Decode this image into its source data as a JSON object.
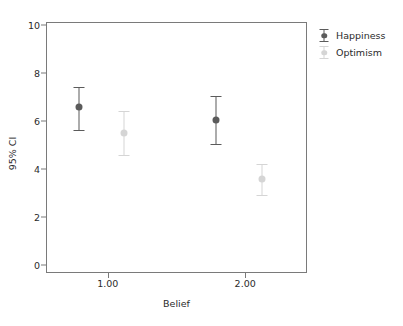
{
  "chart_data": {
    "type": "scatter",
    "title": "",
    "xlabel": "Belief",
    "ylabel": "95% CI",
    "categories": [
      "1.00",
      "2.00"
    ],
    "x": [
      1.0,
      2.0
    ],
    "xlim": [
      0.55,
      2.45
    ],
    "ylim": [
      0,
      10
    ],
    "ytick_labels": [
      "0",
      "2",
      "4",
      "6",
      "8",
      "10"
    ],
    "ytick_values": [
      0,
      2,
      4,
      6,
      8,
      10
    ],
    "xtick_labels": [
      "1.00",
      "2.00"
    ],
    "xtick_values": [
      1.0,
      2.0
    ],
    "grid": false,
    "legend_position": "right",
    "series": [
      {
        "name": "Happiness",
        "color": "#5b5b5b",
        "values": [
          6.58,
          6.04
        ],
        "ci_lower": [
          5.63,
          5.04
        ],
        "ci_upper": [
          7.42,
          7.04
        ],
        "x_offsets": [
          0.79,
          1.79
        ]
      },
      {
        "name": "Optimism",
        "color": "#d5d5d5",
        "values": [
          5.5,
          3.58
        ],
        "ci_lower": [
          4.6,
          2.9
        ],
        "ci_upper": [
          6.42,
          4.2
        ],
        "x_offsets": [
          1.12,
          2.12
        ]
      }
    ]
  },
  "axes": {
    "y_title": "95% CI",
    "x_title": "Belief",
    "y_ticks": [
      "10",
      "8",
      "6",
      "4",
      "2",
      "0"
    ],
    "x_ticks": [
      "1.00",
      "2.00"
    ]
  },
  "legend": {
    "entries": [
      {
        "label": "Happiness",
        "color": "#5b5b5b"
      },
      {
        "label": "Optimism",
        "color": "#d5d5d5"
      }
    ]
  },
  "colors": {
    "frame": "#7a7a7a",
    "text": "#2b2b2b",
    "background": "#ffffff",
    "happiness": "#5b5b5b",
    "optimism": "#d5d5d5"
  }
}
